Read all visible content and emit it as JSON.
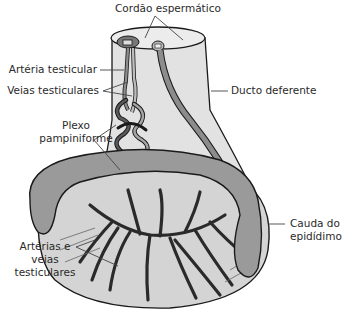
{
  "labels": {
    "cordao": "Cordão espermático",
    "arteria_testicular": "Artéria testicular",
    "veias_testiculares": "Veias testiculares",
    "plexo_line1": "Plexo",
    "plexo_line2": "pampiniforme",
    "ducto": "Ducto deferente",
    "cauda_line1": "Cauda do",
    "cauda_line2": "epidídimo",
    "art_veias_line1": "Artérias e",
    "art_veias_line2": "veias",
    "art_veias_line3": "testiculares"
  },
  "colors": {
    "outline": "#1a1a1a",
    "cord_fill": "#e2e2e2",
    "epididymis_fill": "#9a9a9a",
    "testis_fill": "#d4d4d4",
    "vessel_dark": "#3a3a3a",
    "vessel_light": "#8c8c8c",
    "leader": "#444444"
  }
}
